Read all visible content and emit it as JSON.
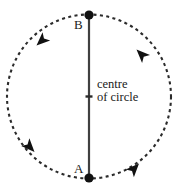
{
  "figure": {
    "background_color": "#ffffff",
    "stroke_color": "#2b2b2b",
    "text_color": "#1a1a1a",
    "labels": {
      "point_b": "B",
      "point_a": "A",
      "centre_line1": "centre",
      "centre_line2": "of circle"
    },
    "geometry": {
      "center_x": 89,
      "center_y": 96.5,
      "radius": 82,
      "circle_style": "dashed",
      "dash_pattern": "3 3",
      "diameter_from": "A",
      "diameter_to": "B",
      "point_b_xy": "(89, 15)",
      "point_a_xy": "(89, 178)",
      "arrow_direction": "counterclockwise",
      "arrow_count": 4
    },
    "arrows": [
      {
        "name": "arrow-top-right",
        "angle_deg": 55,
        "points": "up-left"
      },
      {
        "name": "arrow-top-left",
        "angle_deg": 125,
        "points": "down-left"
      },
      {
        "name": "arrow-bottom-left",
        "angle_deg": 215,
        "points": "down-right"
      },
      {
        "name": "arrow-bottom-right",
        "angle_deg": 325,
        "points": "up-right"
      }
    ]
  }
}
